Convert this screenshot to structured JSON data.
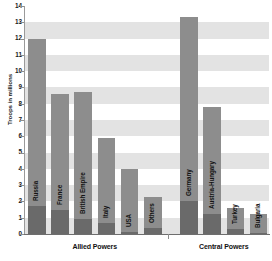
{
  "chart_data": {
    "type": "bar",
    "title": "",
    "xlabel": "",
    "ylabel": "Troops in millions",
    "ylim": [
      0,
      14
    ],
    "ytick_values": [
      0,
      1,
      2,
      3,
      4,
      5,
      6,
      7,
      8,
      9,
      10,
      11,
      12,
      13,
      14
    ],
    "ytick_labels": [
      "0",
      "1",
      "2",
      "3",
      "4",
      "5",
      "6",
      "7",
      "8",
      "9",
      "10",
      "11",
      "12",
      "13",
      "14"
    ],
    "grid": "horizontal-bands",
    "legend": "none",
    "groups": [
      {
        "name": "Allied Powers",
        "categories": [
          "Russia",
          "France",
          "British Empire",
          "Italy",
          "USA",
          "Others"
        ],
        "values": [
          12.0,
          8.6,
          8.7,
          5.9,
          4.0,
          2.3
        ],
        "lower_segment_values": [
          1.7,
          1.45,
          0.9,
          0.65,
          0.13,
          0.35
        ]
      },
      {
        "name": "Central Powers",
        "categories": [
          "Germany",
          "Austria-Hungary",
          "Turkey",
          "Bulgaria"
        ],
        "values": [
          13.35,
          7.8,
          1.6,
          1.2
        ],
        "lower_segment_values": [
          2.0,
          1.2,
          0.33,
          0.09
        ]
      }
    ],
    "series": [
      {
        "name": "Total mobilized",
        "categories": [
          "Russia",
          "France",
          "British Empire",
          "Italy",
          "USA",
          "Others",
          "Germany",
          "Austria-Hungary",
          "Turkey",
          "Bulgaria"
        ],
        "values": [
          12.0,
          8.6,
          8.7,
          5.9,
          4.0,
          2.3,
          13.35,
          7.8,
          1.6,
          1.2
        ]
      },
      {
        "name": "Lower segment",
        "categories": [
          "Russia",
          "France",
          "British Empire",
          "Italy",
          "USA",
          "Others",
          "Germany",
          "Austria-Hungary",
          "Turkey",
          "Bulgaria"
        ],
        "values": [
          1.7,
          1.45,
          0.9,
          0.65,
          0.13,
          0.35,
          2.0,
          1.2,
          0.33,
          0.09
        ]
      }
    ]
  },
  "colors": {
    "bar_light": "#8d8d8d",
    "bar_dark": "#6a6a6a",
    "band": "#e3e3e3",
    "background": "#ffffff",
    "axis": "#8d8d8d",
    "text": "#141414"
  }
}
